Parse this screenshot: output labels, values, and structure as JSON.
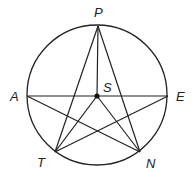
{
  "diagram": {
    "type": "geometry",
    "circle": {
      "cx": 97,
      "cy": 95,
      "r": 70
    },
    "points": [
      {
        "name": "P",
        "x": 98,
        "y": 26,
        "label_x": 94,
        "label_y": 17
      },
      {
        "name": "A",
        "x": 27,
        "y": 96,
        "label_x": 10,
        "label_y": 101
      },
      {
        "name": "E",
        "x": 168,
        "y": 96,
        "label_x": 176,
        "label_y": 101
      },
      {
        "name": "T",
        "x": 55,
        "y": 152,
        "label_x": 37,
        "label_y": 167
      },
      {
        "name": "N",
        "x": 140,
        "y": 152,
        "label_x": 146,
        "label_y": 168
      },
      {
        "name": "S",
        "x": 97,
        "y": 96,
        "label_x": 103,
        "label_y": 92
      }
    ],
    "segments": [
      [
        "P",
        "T"
      ],
      [
        "P",
        "N"
      ],
      [
        "P",
        "S"
      ],
      [
        "A",
        "E"
      ],
      [
        "A",
        "N"
      ],
      [
        "E",
        "T"
      ],
      [
        "S",
        "T"
      ],
      [
        "S",
        "N"
      ]
    ],
    "stroke_color": "#222222"
  }
}
